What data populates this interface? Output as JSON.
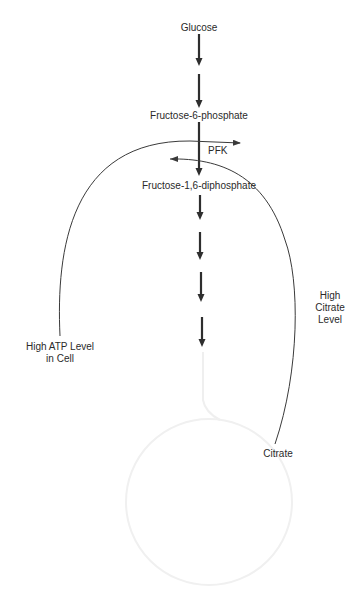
{
  "diagram": {
    "nodes": {
      "glucose": "Glucose",
      "f6p": "Fructose-6-phosphate",
      "enzyme": "PFK",
      "f16bp": "Fructose-1,6-diphosphate",
      "citrate": "Citrate"
    },
    "regulators": {
      "atp": [
        "High ATP Level",
        "in Cell"
      ],
      "citrate": [
        "High",
        "Citrate",
        "Level"
      ]
    },
    "pathway_steps": [
      "Glucose",
      "Fructose-6-phosphate",
      "Fructose-1,6-diphosphate",
      "Citrate"
    ],
    "feedback": [
      {
        "from": "High ATP Level in Cell",
        "to": "PFK",
        "effect": "inhibits"
      },
      {
        "from": "High Citrate Level",
        "to": "PFK",
        "effect": "inhibits"
      }
    ],
    "colors": {
      "main_arrow": "#2e2e2e",
      "feedback_line": "#3a3a3a",
      "cycle_faint": "#eeeeee",
      "text": "#2a2a2a"
    }
  }
}
